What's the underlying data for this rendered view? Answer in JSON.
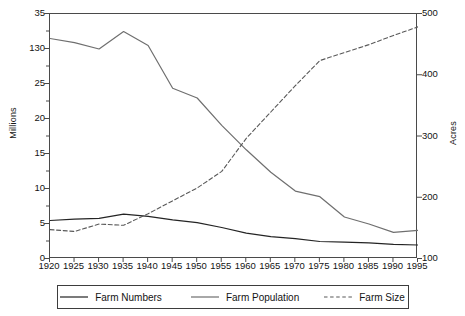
{
  "chart_data": {
    "type": "line",
    "title": "",
    "xlabel": "",
    "ylabel": "Millions",
    "y2label": "Acres",
    "grid": false,
    "legend_position": "bottom",
    "x": [
      1920,
      1925,
      1930,
      1935,
      1940,
      1945,
      1950,
      1955,
      1960,
      1965,
      1970,
      1975,
      1980,
      1985,
      1990,
      1995
    ],
    "xtick_labels": [
      "1920",
      "1925",
      "1930",
      "1935",
      "1940",
      "1945",
      "1950",
      "1955",
      "1960",
      "1965",
      "1970",
      "1975",
      "1980",
      "1985",
      "1990",
      "1995"
    ],
    "xlim": [
      1920,
      1995
    ],
    "ylim": [
      0,
      35
    ],
    "ytick_labels": [
      "0",
      "5",
      "10",
      "15",
      "20",
      "25",
      "130",
      "35"
    ],
    "ytick_values": [
      0,
      5,
      10,
      15,
      20,
      25,
      30,
      35
    ],
    "y2lim": [
      100,
      500
    ],
    "y2tick_labels": [
      "100",
      "200",
      "300",
      "400",
      "500"
    ],
    "y2tick_values": [
      100,
      200,
      300,
      400,
      500
    ],
    "series": [
      {
        "name": "Farm Numbers",
        "axis": "left",
        "style": "solid",
        "color": "#242424",
        "width": 1.2,
        "values": [
          5.5,
          5.7,
          5.8,
          6.4,
          6.1,
          5.6,
          5.2,
          4.5,
          3.7,
          3.2,
          2.9,
          2.5,
          2.4,
          2.3,
          2.1,
          2.0
        ]
      },
      {
        "name": "Farm Population",
        "axis": "left",
        "style": "solid",
        "color": "#6f6f6f",
        "width": 1.2,
        "values": [
          31.5,
          30.9,
          30.0,
          32.5,
          30.5,
          24.4,
          23.0,
          19.1,
          15.6,
          12.4,
          9.7,
          8.9,
          6.0,
          5.0,
          3.8,
          4.1
        ]
      },
      {
        "name": "Farm Size",
        "axis": "right",
        "style": "dashed",
        "color": "#595959",
        "width": 1.1,
        "values": [
          148,
          145,
          157,
          155,
          174,
          195,
          216,
          243,
          297,
          340,
          383,
          424,
          437,
          450,
          465,
          479
        ]
      }
    ]
  },
  "legend": {
    "items": [
      {
        "label": "Farm Numbers",
        "style": "solid",
        "color": "#242424"
      },
      {
        "label": "Farm Population",
        "style": "solid",
        "color": "#6f6f6f"
      },
      {
        "label": "Farm Size",
        "style": "dashed",
        "color": "#595959"
      }
    ]
  }
}
